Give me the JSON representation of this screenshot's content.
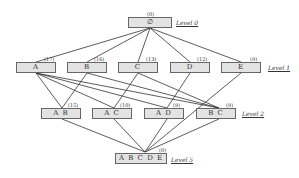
{
  "diagram": {
    "levels": [
      {
        "label": "Level 0",
        "nodes": [
          {
            "id": "root",
            "label": "∅",
            "count": "(0)"
          }
        ]
      },
      {
        "label": "Level 1",
        "nodes": [
          {
            "id": "A",
            "label": "A",
            "count": "(17)"
          },
          {
            "id": "B",
            "label": "B",
            "count": "(16)"
          },
          {
            "id": "C",
            "label": "C",
            "count": "(13)"
          },
          {
            "id": "D",
            "label": "D",
            "count": "(12)"
          },
          {
            "id": "E",
            "label": "E",
            "count": "(9)"
          }
        ]
      },
      {
        "label": "Level 2",
        "nodes": [
          {
            "id": "AB",
            "label": "A B",
            "count": "(15)"
          },
          {
            "id": "AC",
            "label": "A C",
            "count": "(10)"
          },
          {
            "id": "AD",
            "label": "A D",
            "count": "(9)"
          },
          {
            "id": "BC",
            "label": "B C",
            "count": "(9)"
          }
        ]
      },
      {
        "label": "Level 5",
        "nodes": [
          {
            "id": "ABCDE",
            "label": "A B C D E",
            "count": "(0)"
          }
        ]
      }
    ],
    "edges": [
      [
        "root",
        "A"
      ],
      [
        "root",
        "B"
      ],
      [
        "root",
        "C"
      ],
      [
        "root",
        "D"
      ],
      [
        "root",
        "E"
      ],
      [
        "A",
        "AB"
      ],
      [
        "A",
        "AD"
      ],
      [
        "A",
        "BC"
      ],
      [
        "B",
        "AB"
      ],
      [
        "B",
        "BC"
      ],
      [
        "C",
        "AC"
      ],
      [
        "C",
        "AD"
      ],
      [
        "D",
        "AD"
      ],
      [
        "E",
        "BC"
      ],
      [
        "A",
        "AC"
      ],
      [
        "AB",
        "ABCDE"
      ],
      [
        "AC",
        "ABCDE"
      ],
      [
        "AD",
        "ABCDE"
      ],
      [
        "BC",
        "ABCDE"
      ],
      [
        "E",
        "ABCDE"
      ]
    ]
  }
}
